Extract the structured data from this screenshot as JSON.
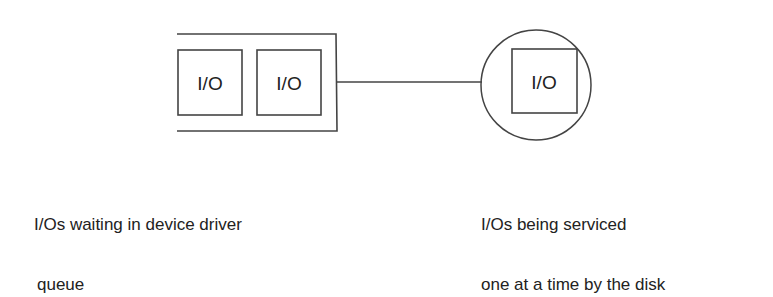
{
  "diagram": {
    "queue": {
      "items": [
        {
          "label": "I/O"
        },
        {
          "label": "I/O"
        }
      ],
      "caption_line1": "I/Os waiting in device driver",
      "caption_line2": "queue"
    },
    "disk": {
      "item": {
        "label": "I/O"
      },
      "caption_line1": "I/Os being serviced",
      "caption_line2": "one at a time by the disk"
    },
    "colors": {
      "stroke": "#444444",
      "text": "#222222",
      "background": "#ffffff"
    }
  }
}
